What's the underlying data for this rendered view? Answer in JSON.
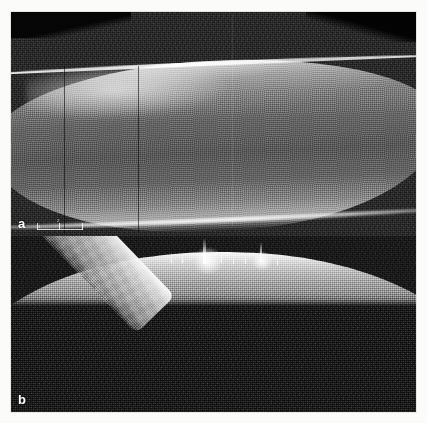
{
  "figure": {
    "type": "oct-scan-figure",
    "background_color": "#fbfbfa",
    "frame_color": "#0b0b0b",
    "panel_count": 2
  },
  "panels": [
    {
      "id": "a",
      "label": "a",
      "modality": "optical-coherence-tomography",
      "region": "anterior-segment-cross-section",
      "background_color": "#1d1d1d",
      "tissue_color": "#b4b4b4",
      "description": "Wide thick hyperreflective corneal slab with bright anterior and posterior boundary lines",
      "scalebar": {
        "label_left": "1",
        "label_mid": "2",
        "tick_count": 3,
        "color": "#ffffff"
      },
      "vertical_markers": [
        {
          "x": 53,
          "opacity": "dark"
        },
        {
          "x": 127,
          "opacity": "dark"
        },
        {
          "x": 221,
          "opacity": "faint"
        }
      ]
    },
    {
      "id": "b",
      "label": "b",
      "modality": "optical-coherence-tomography",
      "region": "corneal-arc-cross-section",
      "background_color": "#0e0e0e",
      "tissue_color": "#e2e2e2",
      "description": "Bright arc-shaped corneal band with specular saturation spikes at the apex and a descending left limb",
      "specular_spikes": [
        {
          "x": 192,
          "height": 26
        },
        {
          "x": 249,
          "height": 20
        }
      ],
      "marker_line": {
        "x": 196,
        "top": 52,
        "height": 112,
        "color": "#ffffff"
      }
    }
  ],
  "labels": {
    "panel_a": "a",
    "panel_b": "b"
  }
}
